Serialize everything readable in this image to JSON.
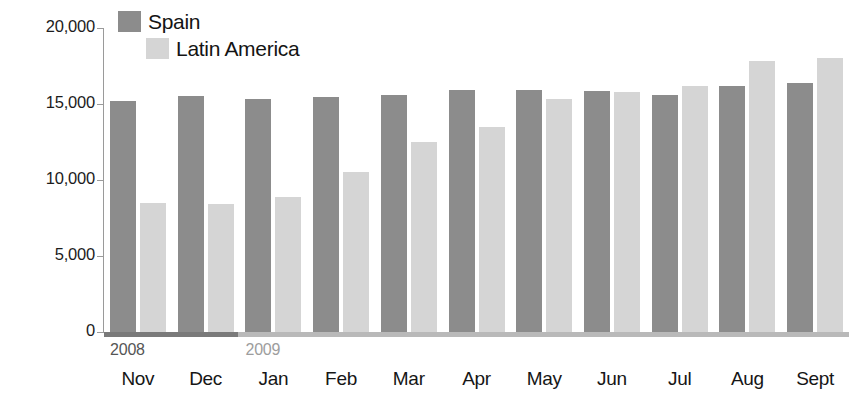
{
  "chart_data": {
    "type": "bar",
    "title": "",
    "subtitle": "",
    "xlabel": "",
    "ylabel": "",
    "ylim": [
      0,
      20000
    ],
    "yticks": [
      "0",
      "5,000",
      "10,000",
      "15,000",
      "20,000"
    ],
    "ytick_values": [
      0,
      5000,
      10000,
      15000,
      20000
    ],
    "grid": false,
    "legend_position": "top-left",
    "categories": [
      "Nov",
      "Dec",
      "Jan",
      "Feb",
      "Mar",
      "Apr",
      "May",
      "Jun",
      "Jul",
      "Aug",
      "Sept"
    ],
    "period_labels": [
      {
        "text": "2008",
        "starts_at_category": "Nov",
        "color": "#555555"
      },
      {
        "text": "2009",
        "starts_at_category": "Jan",
        "color": "#9d9d9d"
      }
    ],
    "series": [
      {
        "name": "Spain",
        "color": "#8c8c8c",
        "values": [
          15200,
          15500,
          15350,
          15450,
          15600,
          15900,
          15950,
          15850,
          15600,
          16200,
          16400
        ]
      },
      {
        "name": "Latin America",
        "color": "#d5d5d5",
        "values": [
          8500,
          8450,
          8900,
          10500,
          12500,
          13500,
          15300,
          15800,
          16200,
          17800,
          18000
        ]
      }
    ]
  },
  "legend": {
    "items": [
      {
        "label": "Spain"
      },
      {
        "label": "Latin America"
      }
    ]
  }
}
